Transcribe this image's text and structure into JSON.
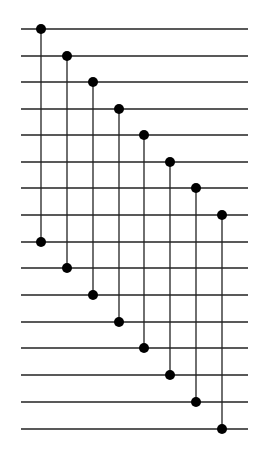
{
  "diagram": {
    "type": "comparator-network",
    "wire_count": 16,
    "wires_y": [
      29,
      56,
      82,
      109,
      135,
      162,
      188,
      215,
      242,
      268,
      295,
      322,
      348,
      375,
      402,
      429
    ],
    "wire_x_start": 21,
    "wire_x_end": 248,
    "comparators": [
      {
        "x": 41,
        "from": 0,
        "to": 8
      },
      {
        "x": 67,
        "from": 1,
        "to": 9
      },
      {
        "x": 93,
        "from": 2,
        "to": 10
      },
      {
        "x": 119,
        "from": 3,
        "to": 11
      },
      {
        "x": 144,
        "from": 4,
        "to": 12
      },
      {
        "x": 170,
        "from": 5,
        "to": 13
      },
      {
        "x": 196,
        "from": 6,
        "to": 14
      },
      {
        "x": 222,
        "from": 7,
        "to": 15
      }
    ],
    "colors": {
      "line": "#222222",
      "node": "#000000",
      "background": "#ffffff"
    }
  }
}
